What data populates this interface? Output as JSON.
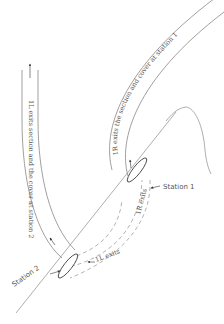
{
  "labels": {
    "station1": "Station 1",
    "station2": "Station 2",
    "exit_1L_full": "1L exits section and the cover at station 2",
    "exit_1R_full": "1R exits the section and cover at station 1",
    "exit_1L_short": "1L exits",
    "exit_1R_short": "1R exits"
  },
  "colors": {
    "line": "#888888",
    "text": "#555555",
    "dashed": "#999999",
    "background": "#ffffff"
  }
}
